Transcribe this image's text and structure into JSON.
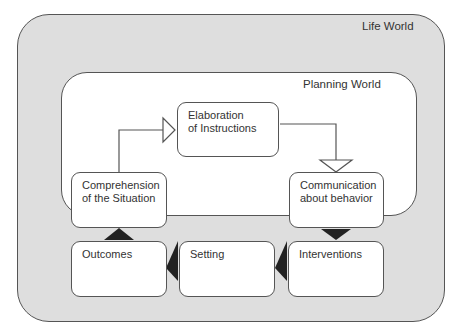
{
  "diagram": {
    "outer_region": {
      "label": "Life World",
      "fill": "#dedede"
    },
    "inner_region": {
      "label": "Planning World",
      "fill": "#ffffff"
    },
    "nodes": [
      {
        "id": "elaboration",
        "label_line1": "Elaboration",
        "label_line2": "of Instructions"
      },
      {
        "id": "communication",
        "label_line1": "Communication",
        "label_line2": "about behavior"
      },
      {
        "id": "comprehension",
        "label_line1": "Comprehension",
        "label_line2": "of the Situation"
      },
      {
        "id": "interventions",
        "label_line1": "Interventions",
        "label_line2": ""
      },
      {
        "id": "setting",
        "label_line1": "Setting",
        "label_line2": ""
      },
      {
        "id": "outcomes",
        "label_line1": "Outcomes",
        "label_line2": ""
      }
    ],
    "edges": [
      {
        "from": "comprehension",
        "to": "elaboration",
        "style": "hollow-arrow"
      },
      {
        "from": "elaboration",
        "to": "communication",
        "style": "hollow-arrow"
      },
      {
        "from": "communication",
        "to": "interventions",
        "style": "filled-arrow"
      },
      {
        "from": "interventions",
        "to": "setting",
        "style": "filled-arrow"
      },
      {
        "from": "setting",
        "to": "outcomes",
        "style": "filled-arrow"
      },
      {
        "from": "outcomes",
        "to": "comprehension",
        "style": "filled-arrow"
      }
    ]
  }
}
